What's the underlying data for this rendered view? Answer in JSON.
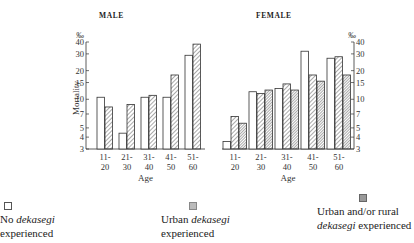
{
  "figure": {
    "yaxis_unit": "‰",
    "yaxis_label": "Mortality",
    "xaxis_label": "Age",
    "yticks": [
      3,
      4,
      5,
      7,
      10,
      15,
      20,
      30,
      40
    ]
  },
  "legend": [
    {
      "swatch": "open",
      "line1_pre": "No ",
      "line1_em": "dekasegi",
      "line2_pre": "",
      "line2_em": "",
      "line2_post": "experienced"
    },
    {
      "swatch": "urban",
      "line1_pre": "Urban ",
      "line1_em": "dekasegi",
      "line2_pre": "",
      "line2_em": "",
      "line2_post": "experienced"
    },
    {
      "swatch": "rural",
      "line1_pre": "Urban and/or rural",
      "line1_em": "",
      "line2_pre": "",
      "line2_em": "dekasegi",
      "line2_post": " experienced"
    }
  ],
  "chart_data": [
    {
      "type": "bar",
      "title": "MALE",
      "xlabel": "Age",
      "ylabel": "Mortality (‰)",
      "yscale": "log",
      "ylim": [
        3,
        40
      ],
      "yticks": [
        3,
        4,
        5,
        7,
        10,
        15,
        20,
        30,
        40
      ],
      "categories": [
        "11-20",
        "21-30",
        "31-40",
        "41-50",
        "51-60"
      ],
      "series": [
        {
          "name": "No dekasegi experienced",
          "pattern": "open",
          "values": [
            10.5,
            4.4,
            10.5,
            10.5,
            29
          ]
        },
        {
          "name": "Urban dekasegi experienced",
          "pattern": "hatched",
          "values": [
            8.3,
            8.8,
            11,
            18,
            38
          ]
        }
      ]
    },
    {
      "type": "bar",
      "title": "FEMALE",
      "xlabel": "Age",
      "ylabel": "Mortality (‰)",
      "yscale": "log",
      "ylim": [
        3,
        40
      ],
      "yticks": [
        3,
        4,
        5,
        7,
        10,
        15,
        20,
        30,
        40
      ],
      "axis_side": "right",
      "categories": [
        "11-20",
        "21-30",
        "31-40",
        "41-50",
        "51-60"
      ],
      "series": [
        {
          "name": "No dekasegi experienced",
          "pattern": "open",
          "values": [
            3.6,
            12,
            13,
            32,
            27
          ]
        },
        {
          "name": "Urban dekasegi experienced",
          "pattern": "hatched",
          "values": [
            6.6,
            11.5,
            14.5,
            18,
            28
          ]
        },
        {
          "name": "Urban and/or rural dekasegi experienced",
          "pattern": "dense-hatched",
          "values": [
            5.6,
            12.5,
            12.5,
            15.5,
            18
          ]
        }
      ]
    }
  ]
}
